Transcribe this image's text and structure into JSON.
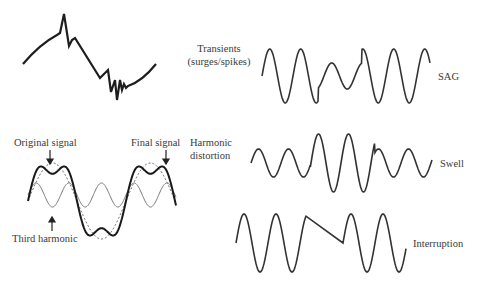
{
  "diagram": {
    "labels": {
      "transients_line1": "Transients",
      "transients_line2": "(surges/spikes)",
      "sag": "SAG",
      "original_signal": "Original signal",
      "final_signal": "Final signal",
      "harmonic_line1": "Harmonic",
      "harmonic_line2": "distortion",
      "third_harmonic": "Third harmonic",
      "swell": "Swell",
      "interruption": "Interruption"
    },
    "panels": [
      {
        "id": "transients",
        "description": "Sine segment with spike transients"
      },
      {
        "id": "sag",
        "description": "Sine wave with reduced amplitude in middle cycles"
      },
      {
        "id": "harmonic",
        "description": "Original sine (dotted), third harmonic (thin), final distorted signal (bold)"
      },
      {
        "id": "swell",
        "description": "Sine wave with increased amplitude in middle cycles"
      },
      {
        "id": "interruption",
        "description": "Sine wave with flat zero segment"
      }
    ],
    "colors": {
      "stroke": "#2a2a2a",
      "thin": "#555555",
      "text": "#3a3a3a"
    }
  }
}
